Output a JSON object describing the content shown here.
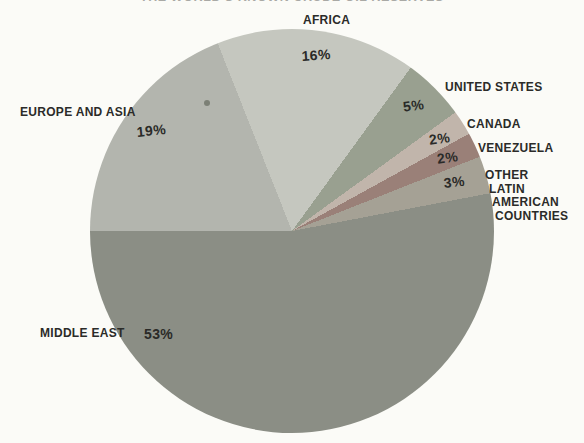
{
  "page": {
    "background": "#fbfbf7",
    "clipped_title": "THE WORLD'S KNOWN CRUDE OIL RESERVES"
  },
  "chart_data": {
    "type": "pie",
    "title": "THE WORLD'S KNOWN CRUDE OIL RESERVES",
    "legend_position": "around",
    "start_angle_deg": -21.6,
    "center_px": {
      "x": 292,
      "y": 231
    },
    "radius_px": 202,
    "slices": [
      {
        "label": "AFRICA",
        "value": 16,
        "pct_text": "16%",
        "color": "#c5c7bf"
      },
      {
        "label": "UNITED STATES",
        "value": 5,
        "pct_text": "5%",
        "color": "#99a090"
      },
      {
        "label": "CANADA",
        "value": 2,
        "pct_text": "2%",
        "color": "#c1b5ab"
      },
      {
        "label": "VENEZUELA",
        "value": 2,
        "pct_text": "2%",
        "color": "#9a8078"
      },
      {
        "label": "OTHER LATIN AMERICAN COUNTRIES",
        "lines": [
          "OTHER",
          "LATIN",
          "AMERICAN",
          "COUNTRIES"
        ],
        "value": 3,
        "pct_text": "3%",
        "color": "#a5a195"
      },
      {
        "label": "MIDDLE EAST",
        "value": 53,
        "pct_text": "53%",
        "color": "#8b8e85"
      },
      {
        "label": "EUROPE AND ASIA",
        "value": 19,
        "pct_text": "19%",
        "color": "#b3b5ae"
      }
    ]
  }
}
